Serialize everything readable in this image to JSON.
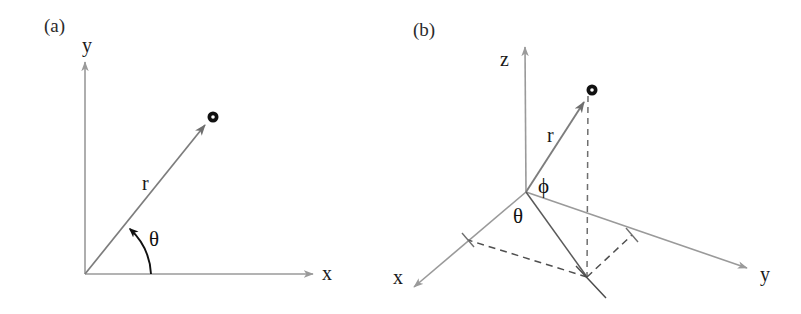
{
  "figure": {
    "background_color": "#ffffff",
    "width": 801,
    "height": 314
  },
  "colors": {
    "axis_gray": "#9a9a9a",
    "vector_gray": "#7d7d7d",
    "dark_line": "#5a5a5a",
    "dashed_gray": "#6f6f6f",
    "arc_black": "#111111",
    "point_black": "#111111",
    "text_black": "#1a1a1a",
    "panel_label": "#2b2b2b"
  },
  "panels": [
    {
      "id": "panel-a",
      "label": "(a)",
      "label_pos": {
        "x": 44,
        "y": 32
      },
      "system": "2D polar coordinates",
      "axes": [
        {
          "name": "y-axis",
          "label": "y",
          "label_pos": {
            "x": 82,
            "y": 52
          },
          "from": {
            "x": 85,
            "y": 274
          },
          "to": {
            "x": 85,
            "y": 62
          }
        },
        {
          "name": "x-axis",
          "label": "x",
          "label_pos": {
            "x": 322,
            "y": 280
          },
          "from": {
            "x": 85,
            "y": 274
          },
          "to": {
            "x": 313,
            "y": 274
          }
        }
      ],
      "origin": {
        "x": 85,
        "y": 274
      },
      "vector": {
        "name": "r",
        "label": "r",
        "label_pos": {
          "x": 142,
          "y": 190
        },
        "from": {
          "x": 85,
          "y": 274
        },
        "to": {
          "x": 205,
          "y": 125
        }
      },
      "point": {
        "name": "point-marker",
        "pos": {
          "x": 213,
          "y": 117
        },
        "outer_radius": 5.5,
        "inner_radius": 1.8
      },
      "angle": {
        "name": "theta",
        "label": "θ",
        "label_pos": {
          "x": 149,
          "y": 246
        },
        "arc_radius": 66,
        "start_deg": 0,
        "end_deg": 51
      }
    },
    {
      "id": "panel-b",
      "label": "(b)",
      "label_pos": {
        "x": 413,
        "y": 36
      },
      "system": "3D spherical coordinates",
      "axes": [
        {
          "name": "z-axis",
          "label": "z",
          "label_pos": {
            "x": 500,
            "y": 66
          },
          "from": {
            "x": 526,
            "y": 192
          },
          "to": {
            "x": 525,
            "y": 47
          }
        },
        {
          "name": "x-axis",
          "label": "x",
          "label_pos": {
            "x": 393,
            "y": 284
          },
          "from": {
            "x": 526,
            "y": 192
          },
          "to": {
            "x": 414,
            "y": 287
          }
        },
        {
          "name": "y-axis",
          "label": "y",
          "label_pos": {
            "x": 760,
            "y": 281
          },
          "from": {
            "x": 526,
            "y": 192
          },
          "to": {
            "x": 747,
            "y": 268
          }
        }
      ],
      "origin": {
        "x": 526,
        "y": 192
      },
      "vector": {
        "name": "r",
        "label": "r",
        "label_pos": {
          "x": 547,
          "y": 142
        },
        "from": {
          "x": 526,
          "y": 192
        },
        "to": {
          "x": 584,
          "y": 102
        }
      },
      "point": {
        "name": "point-marker",
        "pos": {
          "x": 592,
          "y": 90
        },
        "outer_radius": 5.5,
        "inner_radius": 1.8
      },
      "projection_point": {
        "x": 587,
        "y": 277
      },
      "projection_line": {
        "name": "projection-line",
        "from": {
          "x": 526,
          "y": 192
        },
        "to": {
          "x": 587,
          "y": 277
        }
      },
      "drop_line": {
        "name": "vertical-drop-dashed",
        "from": {
          "x": 588,
          "y": 96
        },
        "to": {
          "x": 587,
          "y": 277
        }
      },
      "dashed_projections": [
        {
          "name": "dashed-to-x-axis",
          "from": {
            "x": 587,
            "y": 277
          },
          "to": {
            "x": 468,
            "y": 240
          }
        },
        {
          "name": "dashed-to-y-axis",
          "from": {
            "x": 587,
            "y": 277
          },
          "to": {
            "x": 632,
            "y": 235
          }
        }
      ],
      "tick_marks": [
        {
          "name": "x-axis-tick",
          "from": {
            "x": 462,
            "y": 233
          },
          "to": {
            "x": 474,
            "y": 247
          }
        },
        {
          "name": "y-axis-tick",
          "from": {
            "x": 626,
            "y": 228
          },
          "to": {
            "x": 638,
            "y": 242
          }
        },
        {
          "name": "projection-tick",
          "from": {
            "x": 576,
            "y": 266
          },
          "to": {
            "x": 604,
            "y": 296
          }
        }
      ],
      "angles": [
        {
          "name": "phi",
          "label": "ϕ",
          "label_pos": {
            "x": 538,
            "y": 193
          }
        },
        {
          "name": "theta",
          "label": "θ",
          "label_pos": {
            "x": 513,
            "y": 223
          }
        }
      ]
    }
  ]
}
